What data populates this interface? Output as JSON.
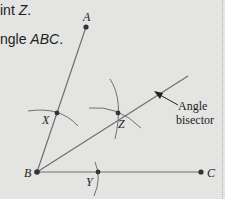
{
  "instructions": {
    "line1_prefix": "int ",
    "line1_point": "Z",
    "line1_suffix": ".",
    "line2_prefix": "ngle ",
    "line2_angle": "ABC",
    "line2_suffix": "."
  },
  "diagram": {
    "points": {
      "A": {
        "label": "A",
        "x": 86,
        "y": 27
      },
      "B": {
        "label": "B",
        "x": 37,
        "y": 172
      },
      "C": {
        "label": "C",
        "x": 201,
        "y": 172
      },
      "X": {
        "label": "X",
        "x": 57,
        "y": 113
      },
      "Y": {
        "label": "Y",
        "x": 98,
        "y": 172
      },
      "Z": {
        "label": "Z",
        "x": 118,
        "y": 113
      }
    },
    "callout": {
      "line1": "Angle",
      "line2": "bisector"
    },
    "colors": {
      "line": "#6f6f6f",
      "point": "#333333",
      "background": "#e4e4e3"
    }
  }
}
